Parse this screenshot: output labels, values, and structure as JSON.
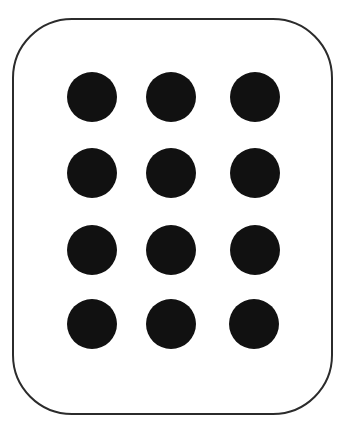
{
  "figure": {
    "shape": "rounded-rectangle",
    "border_color": "#2b2b2b",
    "background_color": "#ffffff",
    "dot_color": "#111111",
    "grid": {
      "rows": 4,
      "columns": 3,
      "dot_count": 12
    },
    "dots": [
      {
        "row": 1,
        "col": 1,
        "cx": 92,
        "cy": 97
      },
      {
        "row": 1,
        "col": 2,
        "cx": 171,
        "cy": 97
      },
      {
        "row": 1,
        "col": 3,
        "cx": 255,
        "cy": 97
      },
      {
        "row": 2,
        "col": 1,
        "cx": 92,
        "cy": 173
      },
      {
        "row": 2,
        "col": 2,
        "cx": 171,
        "cy": 173
      },
      {
        "row": 2,
        "col": 3,
        "cx": 255,
        "cy": 173
      },
      {
        "row": 3,
        "col": 1,
        "cx": 92,
        "cy": 250
      },
      {
        "row": 3,
        "col": 2,
        "cx": 171,
        "cy": 250
      },
      {
        "row": 3,
        "col": 3,
        "cx": 255,
        "cy": 250
      },
      {
        "row": 4,
        "col": 1,
        "cx": 92,
        "cy": 324
      },
      {
        "row": 4,
        "col": 2,
        "cx": 171,
        "cy": 324
      },
      {
        "row": 4,
        "col": 3,
        "cx": 254,
        "cy": 324
      }
    ]
  }
}
